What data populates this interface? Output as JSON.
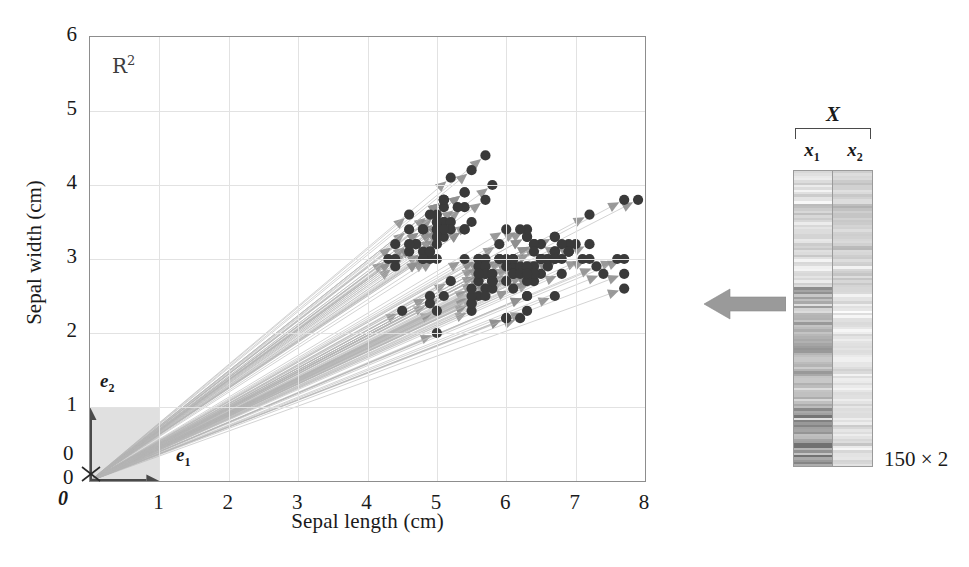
{
  "figure": {
    "space_label": "R",
    "space_exponent": "2"
  },
  "axes": {
    "xlabel": "Sepal length (cm)",
    "ylabel": "Sepal width (cm)",
    "xticks": [
      "0",
      "1",
      "2",
      "3",
      "4",
      "5",
      "6",
      "7",
      "8"
    ],
    "yticks": [
      "0",
      "1",
      "2",
      "3",
      "4",
      "5",
      "6"
    ],
    "xlim": [
      0,
      8
    ],
    "ylim": [
      0,
      6
    ],
    "origin_label_x": "0",
    "origin_label_y": "0",
    "origin_vector_label": "0"
  },
  "basis": {
    "e1": {
      "symbol": "e",
      "index": "1"
    },
    "e2": {
      "symbol": "e",
      "index": "2"
    }
  },
  "matrix": {
    "title": "X",
    "columns": [
      {
        "symbol": "x",
        "index": "1"
      },
      {
        "symbol": "x",
        "index": "2"
      }
    ],
    "dimensions": "150 × 2"
  },
  "colors": {
    "point": "#3a3a3a",
    "ray": "#b5b5b5",
    "arrowhead": "#8f8f8f",
    "basis_vector": "#4a4a4a",
    "unit_square": "#d6d6d6",
    "grid": "#e2e2e2",
    "frame": "#8d8d8d",
    "transfer_arrow": "#9a9a9a"
  },
  "chart_data": {
    "type": "scatter",
    "title": "",
    "xlabel": "Sepal length (cm)",
    "ylabel": "Sepal width (cm)",
    "xlim": [
      0,
      8
    ],
    "ylim": [
      0,
      6
    ],
    "grid": true,
    "legend": null,
    "n_points": 150,
    "annotations": [
      "R^2",
      "e_1",
      "e_2",
      "0",
      "X",
      "x_1",
      "x_2",
      "150 x 2"
    ],
    "x": [
      5.1,
      4.9,
      4.7,
      4.6,
      5.0,
      5.4,
      4.6,
      5.0,
      4.4,
      4.9,
      5.4,
      4.8,
      4.8,
      4.3,
      5.8,
      5.7,
      5.4,
      5.1,
      5.7,
      5.1,
      5.4,
      5.1,
      4.6,
      5.1,
      4.8,
      5.0,
      5.0,
      5.2,
      5.2,
      4.7,
      4.8,
      5.4,
      5.2,
      5.5,
      4.9,
      5.0,
      5.5,
      4.9,
      4.4,
      5.1,
      5.0,
      4.5,
      4.4,
      5.0,
      5.1,
      4.8,
      5.1,
      4.6,
      5.3,
      5.0,
      7.0,
      6.4,
      6.9,
      5.5,
      6.5,
      5.7,
      6.3,
      4.9,
      6.6,
      5.2,
      5.0,
      5.9,
      6.0,
      6.1,
      5.6,
      6.7,
      5.6,
      5.8,
      6.2,
      5.6,
      5.9,
      6.1,
      6.3,
      6.1,
      6.4,
      6.6,
      6.8,
      6.7,
      6.0,
      5.7,
      5.5,
      5.5,
      5.8,
      6.0,
      5.4,
      6.0,
      6.7,
      6.3,
      5.6,
      5.5,
      5.5,
      6.1,
      5.8,
      5.0,
      5.6,
      5.7,
      5.7,
      6.2,
      5.1,
      5.7,
      6.3,
      5.8,
      7.1,
      6.3,
      6.5,
      7.6,
      4.9,
      7.3,
      6.7,
      7.2,
      6.5,
      6.4,
      6.8,
      5.7,
      5.8,
      6.4,
      6.5,
      7.7,
      7.7,
      6.0,
      6.9,
      5.6,
      7.7,
      6.3,
      6.7,
      7.2,
      6.2,
      6.1,
      6.4,
      7.2,
      7.4,
      7.9,
      6.4,
      6.3,
      6.1,
      7.7,
      6.3,
      6.4,
      6.0,
      6.9,
      6.7,
      6.9,
      5.8,
      6.8,
      6.7,
      6.7,
      6.3,
      6.5,
      6.2,
      5.9
    ],
    "y": [
      3.5,
      3.0,
      3.2,
      3.1,
      3.6,
      3.9,
      3.4,
      3.4,
      2.9,
      3.1,
      3.7,
      3.4,
      3.0,
      3.0,
      4.0,
      4.4,
      3.9,
      3.5,
      3.8,
      3.8,
      3.4,
      3.7,
      3.6,
      3.3,
      3.4,
      3.0,
      3.4,
      3.5,
      3.4,
      3.2,
      3.1,
      3.4,
      4.1,
      4.2,
      3.1,
      3.2,
      3.5,
      3.6,
      3.0,
      3.4,
      3.5,
      2.3,
      3.2,
      3.5,
      3.8,
      3.0,
      3.8,
      3.2,
      3.7,
      3.3,
      3.2,
      3.2,
      3.1,
      2.3,
      2.8,
      2.8,
      3.3,
      2.4,
      2.9,
      2.7,
      2.0,
      3.0,
      2.2,
      2.9,
      2.9,
      3.1,
      3.0,
      2.7,
      2.2,
      2.5,
      3.2,
      2.8,
      2.5,
      2.8,
      2.9,
      3.0,
      2.8,
      3.0,
      2.9,
      2.6,
      2.4,
      2.4,
      2.7,
      2.7,
      3.0,
      3.4,
      3.1,
      2.3,
      3.0,
      2.5,
      2.6,
      3.0,
      2.6,
      2.3,
      2.7,
      3.0,
      2.9,
      2.9,
      2.5,
      2.8,
      3.3,
      2.7,
      3.0,
      2.9,
      3.0,
      3.0,
      2.5,
      2.9,
      2.5,
      3.6,
      3.2,
      2.7,
      3.0,
      2.5,
      2.8,
      3.2,
      3.0,
      3.8,
      2.6,
      2.2,
      3.2,
      2.8,
      2.8,
      2.7,
      3.3,
      3.2,
      2.8,
      3.0,
      2.8,
      3.0,
      2.8,
      3.8,
      2.8,
      2.8,
      2.6,
      3.0,
      3.4,
      3.1,
      3.0,
      3.1,
      3.1,
      3.1,
      2.7,
      3.2,
      3.3,
      3.0,
      2.5,
      3.0,
      3.4,
      3.0
    ]
  }
}
